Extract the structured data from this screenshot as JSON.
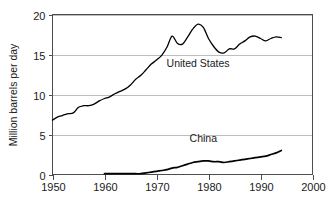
{
  "chart_data": {
    "type": "line",
    "title": "",
    "xlabel": "",
    "ylabel": "Million barrels per day",
    "xlim": [
      1950,
      2000
    ],
    "ylim": [
      0,
      20
    ],
    "xticks": [
      1950,
      1960,
      1970,
      1980,
      1990,
      2000
    ],
    "yticks": [
      0,
      5,
      10,
      15,
      20
    ],
    "grid": "horizontal",
    "legend_position": "inline-annotations",
    "annotations": [
      {
        "text": "United States",
        "x": 1978,
        "y": 13.4
      },
      {
        "text": "China",
        "x": 1979,
        "y": 4.1
      }
    ],
    "series": [
      {
        "name": "United States",
        "label": "United States",
        "color": "#000000",
        "x": [
          1950,
          1951,
          1952,
          1953,
          1954,
          1955,
          1956,
          1957,
          1958,
          1959,
          1960,
          1961,
          1962,
          1963,
          1964,
          1965,
          1966,
          1967,
          1968,
          1969,
          1970,
          1971,
          1972,
          1973,
          1974,
          1975,
          1976,
          1977,
          1978,
          1979,
          1980,
          1981,
          1982,
          1983,
          1984,
          1985,
          1986,
          1987,
          1988,
          1989,
          1990,
          1991,
          1992,
          1993,
          1994
        ],
        "values": [
          6.8,
          7.2,
          7.4,
          7.6,
          7.7,
          8.4,
          8.6,
          8.6,
          8.8,
          9.2,
          9.5,
          9.7,
          10.1,
          10.4,
          10.7,
          11.2,
          11.9,
          12.4,
          13.1,
          13.8,
          14.3,
          14.9,
          15.9,
          17.3,
          16.4,
          16.3,
          17.2,
          18.2,
          18.8,
          18.4,
          17.0,
          16.0,
          15.3,
          15.2,
          15.7,
          15.7,
          16.3,
          16.7,
          17.2,
          17.3,
          17.0,
          16.7,
          17.0,
          17.2,
          17.1
        ]
      },
      {
        "name": "China",
        "label": "China",
        "color": "#000000",
        "x": [
          1960,
          1961,
          1962,
          1963,
          1964,
          1965,
          1966,
          1967,
          1968,
          1969,
          1970,
          1971,
          1972,
          1973,
          1974,
          1975,
          1976,
          1977,
          1978,
          1979,
          1980,
          1981,
          1982,
          1983,
          1984,
          1985,
          1986,
          1987,
          1988,
          1989,
          1990,
          1991,
          1992,
          1993,
          1994
        ],
        "values": [
          0.1,
          0.1,
          0.1,
          0.1,
          0.1,
          0.1,
          0.1,
          0.1,
          0.2,
          0.3,
          0.4,
          0.5,
          0.6,
          0.8,
          0.9,
          1.1,
          1.3,
          1.5,
          1.6,
          1.7,
          1.7,
          1.6,
          1.6,
          1.5,
          1.6,
          1.7,
          1.8,
          1.9,
          2.0,
          2.1,
          2.2,
          2.3,
          2.5,
          2.7,
          3.0
        ]
      }
    ]
  },
  "axes": {
    "y_title": "Million barrels per day",
    "y_tick_labels": [
      "0",
      "5",
      "10",
      "15",
      "20"
    ],
    "x_tick_labels": [
      "1950",
      "1960",
      "1970",
      "1980",
      "1990",
      "2000"
    ]
  },
  "labels": {
    "united_states": "United States",
    "china": "China"
  }
}
